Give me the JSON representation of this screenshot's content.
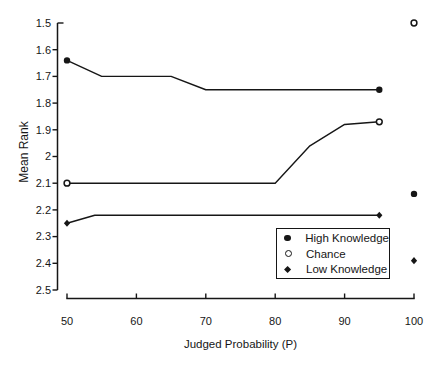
{
  "figure": {
    "background": "#ffffff",
    "ink_color": "#161616"
  },
  "chart_data": {
    "type": "line",
    "title": "",
    "xlabel": "Judged Probability (P)",
    "ylabel": "Mean Rank",
    "x_axis": {
      "range": [
        50,
        100
      ],
      "ticks": [
        "50",
        "60",
        "70",
        "80",
        "90",
        "100"
      ]
    },
    "y_axis": {
      "range": [
        1.5,
        2.5
      ],
      "inverted": true,
      "ticks": [
        "1.5",
        "1.6",
        "1.7",
        "1.8",
        "1.9",
        "2",
        "2.1",
        "2.2",
        "2.3",
        "2.4",
        "2.5"
      ]
    },
    "grid": false,
    "series": [
      {
        "name": "High Knowledge",
        "marker": "filled-circle",
        "line": [
          [
            50,
            1.64
          ],
          [
            55,
            1.7
          ],
          [
            65,
            1.7
          ],
          [
            70,
            1.75
          ],
          [
            95,
            1.75
          ]
        ],
        "marker_points": [
          [
            50,
            1.64
          ],
          [
            95,
            1.75
          ]
        ],
        "isolated_points": [
          [
            100,
            2.14
          ]
        ]
      },
      {
        "name": "Chance",
        "marker": "open-circle",
        "line": [
          [
            50,
            2.1
          ],
          [
            80,
            2.1
          ],
          [
            85,
            1.96
          ],
          [
            90,
            1.88
          ],
          [
            95,
            1.87
          ]
        ],
        "marker_points": [
          [
            50,
            2.1
          ],
          [
            95,
            1.87
          ]
        ],
        "isolated_points": [
          [
            100,
            1.5
          ]
        ]
      },
      {
        "name": "Low Knowledge",
        "marker": "filled-diamond",
        "line": [
          [
            50,
            2.25
          ],
          [
            54,
            2.22
          ],
          [
            95,
            2.22
          ]
        ],
        "marker_points": [
          [
            50,
            2.25
          ],
          [
            95,
            2.22
          ]
        ],
        "isolated_points": [
          [
            100,
            2.39
          ]
        ]
      }
    ],
    "legend": {
      "position": "bottom-right",
      "items": [
        {
          "label": "High Knowledge",
          "marker": "filled-circle"
        },
        {
          "label": "Chance",
          "marker": "open-circle"
        },
        {
          "label": "Low Knowledge",
          "marker": "filled-diamond"
        }
      ]
    }
  }
}
